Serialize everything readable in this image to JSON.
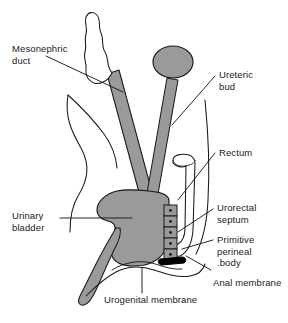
{
  "figure": {
    "background_color": "#ffffff",
    "outline_color": "#1a1a1a",
    "fill_gray": "#9a9a9a",
    "fill_black": "#000000",
    "fill_white": "#ffffff"
  },
  "labels": {
    "mesonephric_duct": "Mesonephric\nduct",
    "ureteric_bud": "Ureteric\nbud",
    "rectum": "Rectum",
    "urorectal_septum": "Urorectal\nseptum",
    "primitive_perineal_body": "Primitive\nperineal\n.body",
    "anal_membrane": "Anal membrane",
    "urinary_bladder": "Urinary\nbladder",
    "urogenital_membrane": "Urogenital membrane"
  },
  "structures": [
    {
      "name": "metanephric-cap",
      "label": "Metanephric cap (scalloped tip)",
      "fill": "#ffffff"
    },
    {
      "name": "mesonephric-duct-shaft",
      "label": "Mesonephric duct shaft",
      "fill": "#9a9a9a"
    },
    {
      "name": "ureteric-bud-cap",
      "label": "Ureteric bud cap (oval)",
      "fill": "#9a9a9a"
    },
    {
      "name": "ureteric-bud-shaft",
      "label": "Ureteric bud shaft",
      "fill": "#9a9a9a"
    },
    {
      "name": "urinary-bladder",
      "label": "Urinary bladder",
      "fill": "#9a9a9a"
    },
    {
      "name": "urethra-phallic",
      "label": "Urethra / phallic part",
      "fill": "#9a9a9a"
    },
    {
      "name": "rectum-tube",
      "label": "Rectum",
      "fill": "#ffffff"
    },
    {
      "name": "urorectal-septum",
      "label": "Urorectal septum",
      "fill": "#9a9a9a"
    },
    {
      "name": "perineal-body",
      "label": "Primitive perineal body",
      "fill": "#000000"
    },
    {
      "name": "body-wall",
      "label": "Body wall outline",
      "fill": "none"
    },
    {
      "name": "perineum-contour",
      "label": "Perineum contour",
      "fill": "none"
    }
  ]
}
